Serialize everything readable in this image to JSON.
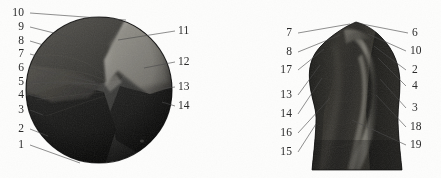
{
  "figure": {
    "background_color": "#fdfdfc",
    "ink_color": "#2b2b2b",
    "panels": [
      {
        "id": "panel-left",
        "name": "spherical-specimen-panel",
        "shape": "circle",
        "labels_left": [
          {
            "n": "10",
            "x": 8,
            "y": 8,
            "lx": 30,
            "ly": 13,
            "ex": 126,
            "ey": 20
          },
          {
            "n": "9",
            "x": 13,
            "y": 22,
            "lx": 30,
            "ly": 27,
            "ex": 74,
            "ey": 38
          },
          {
            "n": "8",
            "x": 13,
            "y": 36,
            "lx": 30,
            "ly": 41,
            "ex": 60,
            "ey": 50
          },
          {
            "n": "7",
            "x": 13,
            "y": 49,
            "lx": 30,
            "ly": 54,
            "ex": 52,
            "ey": 60
          },
          {
            "n": "6",
            "x": 13,
            "y": 63,
            "lx": 30,
            "ly": 68,
            "ex": 95,
            "ey": 82
          },
          {
            "n": "5",
            "x": 13,
            "y": 77,
            "lx": 30,
            "ly": 82,
            "ex": 98,
            "ey": 84
          },
          {
            "n": "4",
            "x": 13,
            "y": 90,
            "lx": 30,
            "ly": 95,
            "ex": 46,
            "ey": 99
          },
          {
            "n": "3",
            "x": 13,
            "y": 105,
            "lx": 30,
            "ly": 110,
            "ex": 43,
            "ey": 115
          },
          {
            "n": "2",
            "x": 13,
            "y": 124,
            "lx": 30,
            "ly": 129,
            "ex": 48,
            "ey": 136
          },
          {
            "n": "1",
            "x": 13,
            "y": 140,
            "lx": 30,
            "ly": 145,
            "ex": 80,
            "ey": 163
          }
        ],
        "labels_right": [
          {
            "n": "11",
            "x": 178,
            "y": 26,
            "lx": 175,
            "ly": 31,
            "ex": 118,
            "ey": 40
          },
          {
            "n": "12",
            "x": 178,
            "y": 57,
            "lx": 175,
            "ly": 62,
            "ex": 144,
            "ey": 68
          },
          {
            "n": "13",
            "x": 178,
            "y": 82,
            "lx": 175,
            "ly": 87,
            "ex": 160,
            "ey": 89
          },
          {
            "n": "14",
            "x": 178,
            "y": 101,
            "lx": 175,
            "ly": 106,
            "ex": 162,
            "ey": 102
          }
        ]
      },
      {
        "id": "panel-right",
        "name": "vessel-specimen-panel",
        "shape": "vessel",
        "labels_left": [
          {
            "n": "7",
            "x": 60,
            "y": 28,
            "lx": 78,
            "ly": 33,
            "ex": 130,
            "ey": 24
          },
          {
            "n": "8",
            "x": 63,
            "y": 47,
            "lx": 78,
            "ly": 52,
            "ex": 120,
            "ey": 35
          },
          {
            "n": "17",
            "x": 57,
            "y": 65,
            "lx": 78,
            "ly": 70,
            "ex": 104,
            "ey": 49
          },
          {
            "n": "13",
            "x": 60,
            "y": 90,
            "lx": 78,
            "ly": 95,
            "ex": 100,
            "ey": 65
          },
          {
            "n": "14",
            "x": 60,
            "y": 109,
            "lx": 78,
            "ly": 114,
            "ex": 102,
            "ey": 78
          },
          {
            "n": "16",
            "x": 60,
            "y": 128,
            "lx": 78,
            "ly": 133,
            "ex": 110,
            "ey": 98
          },
          {
            "n": "15",
            "x": 60,
            "y": 147,
            "lx": 78,
            "ly": 152,
            "ex": 96,
            "ey": 124
          }
        ],
        "labels_right": [
          {
            "n": "6",
            "x": 190,
            "y": 28,
            "lx": 188,
            "ly": 33,
            "ex": 142,
            "ey": 24
          },
          {
            "n": "10",
            "x": 188,
            "y": 46,
            "lx": 186,
            "ly": 51,
            "ex": 148,
            "ey": 34
          },
          {
            "n": "2",
            "x": 192,
            "y": 65,
            "lx": 186,
            "ly": 70,
            "ex": 154,
            "ey": 46
          },
          {
            "n": "4",
            "x": 192,
            "y": 81,
            "lx": 186,
            "ly": 86,
            "ex": 158,
            "ey": 58
          },
          {
            "n": "3",
            "x": 192,
            "y": 103,
            "lx": 186,
            "ly": 108,
            "ex": 160,
            "ey": 79
          },
          {
            "n": "18",
            "x": 188,
            "y": 122,
            "lx": 186,
            "ly": 127,
            "ex": 156,
            "ey": 95
          },
          {
            "n": "19",
            "x": 188,
            "y": 140,
            "lx": 186,
            "ly": 145,
            "ex": 132,
            "ey": 120
          }
        ]
      }
    ]
  }
}
